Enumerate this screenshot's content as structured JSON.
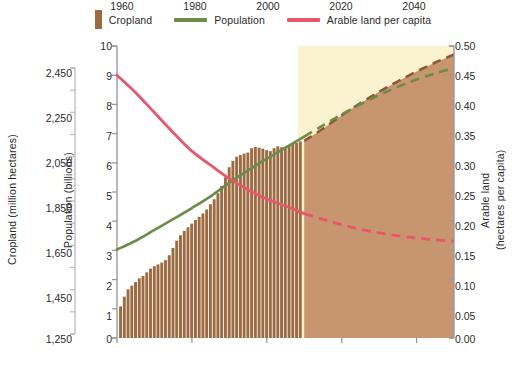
{
  "legend": {
    "items": [
      {
        "label": "Cropland",
        "marker": "bar-swatch",
        "color": "#9c6b42"
      },
      {
        "label": "Population",
        "marker": "line-swatch",
        "color": "#6b8c4a"
      },
      {
        "label": "Arable land per capita",
        "marker": "line-swatch",
        "color": "#e8566a"
      }
    ]
  },
  "annotations": {
    "projected": "Projected to 2050",
    "line_b": "Line B",
    "line_a": "Line A"
  },
  "axes": {
    "cropland": {
      "title": "Cropland (million hectares)",
      "ticks": [
        "2,450",
        "2,250",
        "2,050",
        "1,850",
        "1,650",
        "1,450",
        "1,250"
      ]
    },
    "population": {
      "title": "Population (billions)",
      "ticks": [
        "10",
        "9",
        "8",
        "7",
        "6",
        "5",
        "4",
        "3",
        "2",
        "1",
        "0"
      ]
    },
    "arable": {
      "title_line1": "Arable land",
      "title_line2": "(hectares per capita)",
      "ticks": [
        "0.50",
        "0.45",
        "0.40",
        "0.35",
        "0.30",
        "0.25",
        "0.20",
        "0.15",
        "0.10",
        "0.05",
        "0.00"
      ]
    },
    "x": {
      "ticks": [
        "1960",
        "1980",
        "2000",
        "2020",
        "2040"
      ]
    }
  },
  "chart_data": {
    "type": "line",
    "title": "",
    "xlabel": "",
    "ylabel": "Population (billions)",
    "xlim": [
      1960,
      2050
    ],
    "grid": false,
    "legend_position": "top-center",
    "projection_start_year": 2010,
    "axes_ranges": {
      "cropland_million_hectares": [
        1250,
        2450
      ],
      "population_billions": [
        0,
        10
      ],
      "arable_hectares_per_capita": [
        0.0,
        0.5
      ]
    },
    "series": [
      {
        "name": "Cropland",
        "type": "bar",
        "axis": "cropland_million_hectares",
        "color": "#9c6b42",
        "x": [
          1961,
          1962,
          1963,
          1964,
          1965,
          1966,
          1967,
          1968,
          1969,
          1970,
          1971,
          1972,
          1973,
          1974,
          1975,
          1976,
          1977,
          1978,
          1979,
          1980,
          1981,
          1982,
          1983,
          1984,
          1985,
          1986,
          1987,
          1988,
          1989,
          1990,
          1991,
          1992,
          1993,
          1994,
          1995,
          1996,
          1997,
          1998,
          1999,
          2000,
          2001,
          2002,
          2003,
          2004,
          2005,
          2006,
          2007,
          2008,
          2009
        ],
        "values": [
          1380,
          1420,
          1450,
          1465,
          1480,
          1495,
          1505,
          1520,
          1535,
          1545,
          1552,
          1560,
          1570,
          1590,
          1620,
          1650,
          1672,
          1690,
          1705,
          1720,
          1735,
          1748,
          1762,
          1778,
          1800,
          1820,
          1845,
          1875,
          1910,
          1952,
          1978,
          1995,
          2002,
          2008,
          2012,
          2030,
          2035,
          2032,
          2028,
          2022,
          2018,
          2030,
          2038,
          2034,
          2030,
          2040,
          2048,
          2052,
          2058
        ]
      },
      {
        "name": "Cropland projected (Line B)",
        "type": "area-dashed",
        "axis": "cropland_million_hectares",
        "color": "#9c6b42",
        "x": [
          2010,
          2015,
          2020,
          2025,
          2030,
          2035,
          2040,
          2045,
          2050
        ],
        "values": [
          2060,
          2110,
          2165,
          2215,
          2262,
          2305,
          2345,
          2382,
          2415
        ]
      },
      {
        "name": "Population",
        "type": "line",
        "axis": "population_billions",
        "color": "#6b8c4a",
        "style": "solid",
        "x": [
          1960,
          1965,
          1970,
          1975,
          1980,
          1985,
          1990,
          1995,
          2000,
          2005,
          2010
        ],
        "values": [
          3.03,
          3.33,
          3.7,
          4.07,
          4.45,
          4.85,
          5.32,
          5.74,
          6.14,
          6.52,
          6.9
        ]
      },
      {
        "name": "Population projected",
        "type": "line",
        "axis": "population_billions",
        "color": "#6b8c4a",
        "style": "dashed",
        "x": [
          2010,
          2015,
          2020,
          2025,
          2030,
          2035,
          2040,
          2045,
          2050
        ],
        "values": [
          6.9,
          7.28,
          7.66,
          8.0,
          8.32,
          8.6,
          8.85,
          9.06,
          9.25
        ]
      },
      {
        "name": "Arable land per capita",
        "type": "line",
        "axis": "arable_hectares_per_capita",
        "color": "#e8566a",
        "style": "solid",
        "x": [
          1960,
          1965,
          1970,
          1975,
          1980,
          1985,
          1990,
          1995,
          2000,
          2005,
          2010
        ],
        "values": [
          0.45,
          0.42,
          0.386,
          0.352,
          0.32,
          0.296,
          0.273,
          0.254,
          0.238,
          0.226,
          0.213
        ]
      },
      {
        "name": "Arable land per capita projected (Line A)",
        "type": "line",
        "axis": "arable_hectares_per_capita",
        "color": "#e8566a",
        "style": "dashed",
        "x": [
          2010,
          2015,
          2020,
          2025,
          2030,
          2035,
          2040,
          2045,
          2050
        ],
        "values": [
          0.213,
          0.203,
          0.194,
          0.186,
          0.18,
          0.175,
          0.171,
          0.168,
          0.166
        ]
      }
    ]
  },
  "colors": {
    "cropland": "#9c6b42",
    "cropland_fill": "#c79570",
    "population": "#6b8c4a",
    "arable": "#e8566a",
    "projection_band": "#faf2ce",
    "axis": "#9b9b9b"
  }
}
